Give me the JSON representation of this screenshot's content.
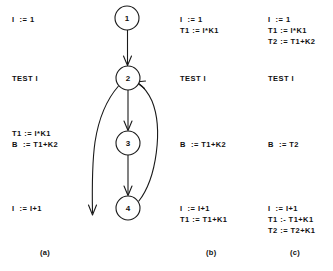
{
  "figure": {
    "columns": [
      {
        "id": "a",
        "caption": "(a)",
        "blocks": [
          {
            "lines": [
              "I  := 1"
            ]
          },
          {
            "lines": [
              "TEST I"
            ]
          },
          {
            "lines": [
              "T1 := I*K1",
              "B  := T1+K2"
            ]
          },
          {
            "lines": [
              "I  := I+1"
            ]
          }
        ]
      },
      {
        "id": "b",
        "caption": "(b)",
        "blocks": [
          {
            "lines": [
              "I  := 1",
              "T1 := I*K1"
            ]
          },
          {
            "lines": [
              "TEST I"
            ]
          },
          {
            "lines": [
              "B  := T1+K2"
            ]
          },
          {
            "lines": [
              "I  := I+1",
              "T1 := T1+K1"
            ]
          }
        ]
      },
      {
        "id": "c",
        "caption": "(c)",
        "blocks": [
          {
            "lines": [
              "I  := 1",
              "T1 := I*K1",
              "T2 := T1+K2"
            ]
          },
          {
            "lines": [
              "TEST I"
            ]
          },
          {
            "lines": [
              "B  := T2"
            ]
          },
          {
            "lines": [
              "I  := I+1",
              "T1 :- T1+K1",
              "T2 := T2+K1"
            ]
          }
        ]
      }
    ],
    "flowgraph": {
      "nodes": [
        {
          "id": "n1",
          "label": "1",
          "cx": 127,
          "cy": 18,
          "r": 12
        },
        {
          "id": "n2",
          "label": "2",
          "cx": 128,
          "cy": 78,
          "r": 12
        },
        {
          "id": "n3",
          "label": "3",
          "cx": 128,
          "cy": 143,
          "r": 12
        },
        {
          "id": "n4",
          "label": "4",
          "cx": 128,
          "cy": 208,
          "r": 12
        }
      ],
      "edges": [
        {
          "id": "e-1-2",
          "from": "1",
          "to": "2",
          "kind": "straight"
        },
        {
          "id": "e-2-3",
          "from": "2",
          "to": "3",
          "kind": "straight"
        },
        {
          "id": "e-3-4",
          "from": "3",
          "to": "4",
          "kind": "straight"
        },
        {
          "id": "e-4-2",
          "from": "4",
          "to": "2",
          "kind": "back-edge-curve"
        },
        {
          "id": "e-2-exit",
          "from": "2",
          "to": "exit",
          "kind": "exit-curve"
        }
      ]
    },
    "colors": {
      "stroke": "#1a1a1a",
      "text": "#111111",
      "background": "#ffffff"
    }
  }
}
